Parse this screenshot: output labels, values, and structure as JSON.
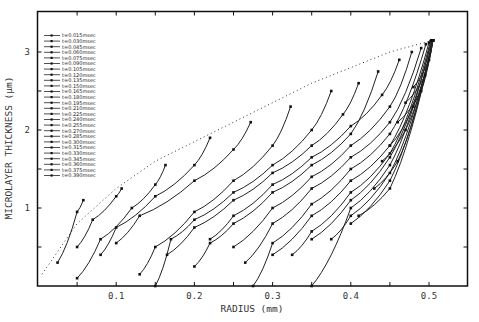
{
  "chart_data": {
    "type": "line",
    "title": "",
    "xlabel": "RADIUS (mm)",
    "ylabel": "MICROLAYER THICKNESS (μm)",
    "xlim": [
      0,
      0.55
    ],
    "ylim": [
      0,
      3.4
    ],
    "x_ticks": [
      0.1,
      0.2,
      0.3,
      0.4,
      0.5
    ],
    "x_tick_labels": [
      "0.1",
      "0.2",
      "0.3",
      "0.4",
      "0.5"
    ],
    "x_minor_step": 0.05,
    "y_ticks": [
      1,
      2,
      3
    ],
    "y_tick_labels": [
      "1",
      "2",
      "3"
    ],
    "y_minor_step": 0.5,
    "grid": false,
    "legend_position": "upper-left",
    "envelope": {
      "style": "dotted",
      "x": [
        0.005,
        0.05,
        0.1,
        0.15,
        0.2,
        0.25,
        0.3,
        0.35,
        0.4,
        0.45,
        0.505
      ],
      "y": [
        0.15,
        0.8,
        1.25,
        1.6,
        1.85,
        2.1,
        2.35,
        2.6,
        2.8,
        3.0,
        3.15
      ]
    },
    "series": [
      {
        "name": "t=0.015msec",
        "x": [
          0.025,
          0.05,
          0.058
        ],
        "y": [
          0.3,
          0.95,
          1.1
        ]
      },
      {
        "name": "t=0.030msec",
        "x": [
          0.05,
          0.07,
          0.1,
          0.107
        ],
        "y": [
          0.5,
          0.85,
          1.15,
          1.25
        ]
      },
      {
        "name": "t=0.045msec",
        "x": [
          0.05,
          0.08,
          0.12,
          0.15,
          0.163
        ],
        "y": [
          0.1,
          0.6,
          1.0,
          1.3,
          1.55
        ]
      },
      {
        "name": "t=0.060msec",
        "x": [
          0.08,
          0.1,
          0.15,
          0.2,
          0.22
        ],
        "y": [
          0.4,
          0.75,
          1.15,
          1.55,
          1.9
        ]
      },
      {
        "name": "t=0.075msec",
        "x": [
          0.1,
          0.13,
          0.2,
          0.25,
          0.272
        ],
        "y": [
          0.55,
          0.9,
          1.35,
          1.75,
          2.1
        ]
      },
      {
        "name": "t=0.090msec",
        "x": [
          0.13,
          0.15,
          0.2,
          0.25,
          0.3,
          0.323
        ],
        "y": [
          0.15,
          0.5,
          0.95,
          1.35,
          1.8,
          2.3
        ]
      },
      {
        "name": "t=0.105msec",
        "x": [
          0.15,
          0.17,
          0.2,
          0.25,
          0.3,
          0.35,
          0.375
        ],
        "y": [
          0.0,
          0.6,
          0.85,
          1.2,
          1.55,
          2.0,
          2.5
        ]
      },
      {
        "name": "t=0.120msec",
        "x": [
          0.165,
          0.2,
          0.25,
          0.3,
          0.35,
          0.39,
          0.41
        ],
        "y": [
          0.4,
          0.75,
          1.1,
          1.45,
          1.8,
          2.2,
          2.6
        ]
      },
      {
        "name": "t=0.135msec",
        "x": [
          0.2,
          0.22,
          0.25,
          0.3,
          0.35,
          0.4,
          0.435
        ],
        "y": [
          0.25,
          0.55,
          0.8,
          1.2,
          1.55,
          1.95,
          2.75
        ]
      },
      {
        "name": "t=0.150msec",
        "x": [
          0.22,
          0.25,
          0.3,
          0.35,
          0.4,
          0.44,
          0.462
        ],
        "y": [
          0.6,
          0.9,
          1.3,
          1.65,
          2.05,
          2.45,
          2.9
        ]
      },
      {
        "name": "t=0.165msec",
        "x": [
          0.25,
          0.3,
          0.35,
          0.4,
          0.45,
          0.478
        ],
        "y": [
          0.5,
          1.0,
          1.4,
          1.8,
          2.3,
          3.0
        ]
      },
      {
        "name": "t=0.180msec",
        "x": [
          0.265,
          0.3,
          0.35,
          0.4,
          0.45,
          0.49
        ],
        "y": [
          0.3,
          0.8,
          1.25,
          1.65,
          2.1,
          3.05
        ]
      },
      {
        "name": "t=0.195msec",
        "x": [
          0.275,
          0.3,
          0.35,
          0.4,
          0.45,
          0.496
        ],
        "y": [
          0.0,
          0.55,
          1.05,
          1.5,
          1.95,
          3.1
        ]
      },
      {
        "name": "t=0.210msec",
        "x": [
          0.3,
          0.35,
          0.4,
          0.45,
          0.5
        ],
        "y": [
          0.4,
          0.9,
          1.35,
          1.8,
          3.12
        ]
      },
      {
        "name": "t=0.225msec",
        "x": [
          0.325,
          0.35,
          0.4,
          0.45,
          0.502
        ],
        "y": [
          0.4,
          0.7,
          1.2,
          1.7,
          3.14
        ]
      },
      {
        "name": "t=0.240msec",
        "x": [
          0.35,
          0.4,
          0.45,
          0.503
        ],
        "y": [
          0.0,
          1.0,
          1.55,
          3.15
        ]
      },
      {
        "name": "t=0.255msec",
        "x": [
          0.35,
          0.4,
          0.45,
          0.504
        ],
        "y": [
          0.6,
          1.1,
          1.65,
          3.15
        ]
      },
      {
        "name": "t=0.270msec",
        "x": [
          0.375,
          0.4,
          0.45,
          0.505
        ],
        "y": [
          0.6,
          0.9,
          1.45,
          3.15
        ]
      },
      {
        "name": "t=0.285msec",
        "x": [
          0.4,
          0.45,
          0.505
        ],
        "y": [
          0.8,
          1.35,
          3.15
        ]
      },
      {
        "name": "t=0.300msec",
        "x": [
          0.41,
          0.45,
          0.505
        ],
        "y": [
          0.9,
          1.25,
          3.15
        ]
      },
      {
        "name": "t=0.315msec",
        "x": [
          0.43,
          0.46,
          0.505
        ],
        "y": [
          1.25,
          1.6,
          3.15
        ]
      },
      {
        "name": "t=0.330msec",
        "x": [
          0.44,
          0.47,
          0.505
        ],
        "y": [
          1.6,
          2.0,
          3.15
        ]
      },
      {
        "name": "t=0.345msec",
        "x": [
          0.45,
          0.48,
          0.505
        ],
        "y": [
          1.8,
          2.3,
          3.15
        ]
      },
      {
        "name": "t=0.360msec",
        "x": [
          0.46,
          0.49,
          0.505
        ],
        "y": [
          2.1,
          2.5,
          3.15
        ]
      },
      {
        "name": "t=0.375msec",
        "x": [
          0.47,
          0.495,
          0.505
        ],
        "y": [
          2.35,
          2.7,
          3.15
        ]
      },
      {
        "name": "t=0.390msec",
        "x": [
          0.48,
          0.5,
          0.505
        ],
        "y": [
          2.55,
          2.9,
          3.15
        ]
      }
    ]
  },
  "legend": {
    "items": [
      "t=0.015msec",
      "t=0.030msec",
      "t=0.045msec",
      "t=0.060msec",
      "t=0.075msec",
      "t=0.090msec",
      "t=0.105msec",
      "t=0.120msec",
      "t=0.135msec",
      "t=0.150msec",
      "t=0.165msec",
      "t=0.180msec",
      "t=0.195msec",
      "t=0.210msec",
      "t=0.225msec",
      "t=0.240msec",
      "t=0.255msec",
      "t=0.270msec",
      "t=0.285msec",
      "t=0.300msec",
      "t=0.315msec",
      "t=0.330msec",
      "t=0.345msec",
      "t=0.360msec",
      "t=0.375msec",
      "t=0.390msec"
    ]
  },
  "colors": {
    "line": "#222222",
    "axis": "#111111",
    "background": "#ffffff"
  }
}
